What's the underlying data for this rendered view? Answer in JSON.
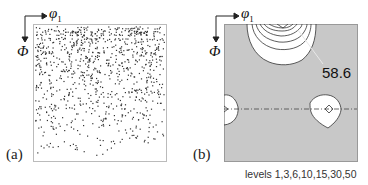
{
  "chart_data": [
    {
      "type": "scatter",
      "panel": "(a)",
      "title": "",
      "xlabel": "φ1",
      "ylabel": "Φ",
      "description": "Scatter of individual orientations in φ1–Φ section; sparse regular grid of points near top, increasing density toward bottom",
      "grid": false,
      "legend": null
    },
    {
      "type": "heatmap",
      "panel": "(b)",
      "subtype": "contour",
      "title": "",
      "xlabel": "φ1",
      "ylabel": "Φ",
      "contour_levels": [
        1,
        3,
        6,
        10,
        15,
        30,
        50
      ],
      "annotations": [
        {
          "text": "58.6",
          "meaning": "maximum intensity",
          "position": "top-center peak"
        }
      ],
      "features": [
        {
          "name": "top-peak",
          "location": "top edge, center",
          "max": 58.6
        },
        {
          "name": "left-edge-peak",
          "location": "left edge, mid-height"
        },
        {
          "name": "center-peak",
          "location": "center, mid-height"
        }
      ],
      "reference_line": "dash-dot horizontal line at mid-height",
      "background_color": "#c8c8c8",
      "grid": false
    }
  ],
  "panels": {
    "a": {
      "label": "(a)",
      "x_axis": "φ",
      "x_sub": "1",
      "y_axis": "Φ"
    },
    "b": {
      "label": "(b)",
      "x_axis": "φ",
      "x_sub": "1",
      "y_axis": "Φ",
      "max_value": "58.6",
      "levels_text": "levels 1,3,6,10,15,30,50"
    }
  }
}
